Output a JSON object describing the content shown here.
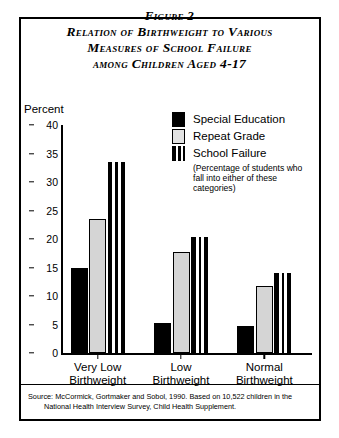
{
  "figure": {
    "title_lines": [
      "Figure 2",
      "Relation of Birthweight to Various",
      "Measures of School Failure",
      "among Children Aged 4-17"
    ],
    "source_line1": "Source: McCormick, Gortmaker and Sobol, 1990. Based on 10,522 children in the",
    "source_line2": "National Health Interview Survey, Child Health Supplement."
  },
  "legend": {
    "items": [
      {
        "label": "Special Education",
        "swatch": "solid-black-icon",
        "color": "#000000"
      },
      {
        "label": "Repeat Grade",
        "swatch": "light-gray-box-icon",
        "color": "#d5d5d5"
      },
      {
        "label": "School Failure",
        "swatch": "vertical-stripe-icon",
        "color": "#000000"
      }
    ],
    "note_lines": [
      "(Percentage of students who",
      "fall into either of these",
      "categories)"
    ]
  },
  "chart_data": {
    "type": "bar",
    "title": "Relation of Birthweight to Various Measures of School Failure among Children Aged 4-17",
    "xlabel": "",
    "ylabel": "Percent",
    "ylim": [
      0,
      40
    ],
    "yticks": [
      0,
      5,
      10,
      15,
      20,
      25,
      30,
      35,
      40
    ],
    "grid": false,
    "legend_position": "upper-right",
    "categories": [
      "Very Low Birthweight",
      "Low Birthweight",
      "Normal Birthweight"
    ],
    "category_label_lines": [
      [
        "Very Low",
        "Birthweight"
      ],
      [
        "Low",
        "Birthweight"
      ],
      [
        "Normal",
        "Birthweight"
      ]
    ],
    "series": [
      {
        "name": "Special Education",
        "values": [
          15.0,
          5.2,
          4.8
        ]
      },
      {
        "name": "Repeat Grade",
        "values": [
          23.5,
          17.7,
          11.7
        ]
      },
      {
        "name": "School Failure",
        "values": [
          33.5,
          20.3,
          14.0
        ]
      }
    ]
  }
}
